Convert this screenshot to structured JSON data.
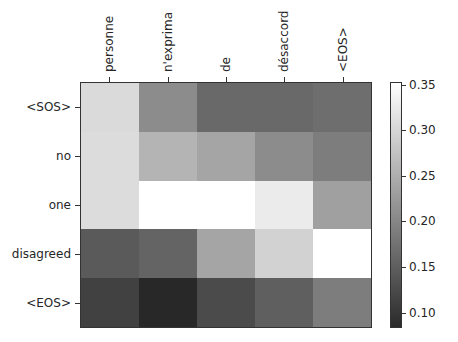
{
  "chart_data": {
    "type": "heatmap",
    "title": "",
    "xlabel": "",
    "ylabel": "",
    "x_labels": [
      "personne",
      "n'exprima",
      "de",
      "désaccord",
      "<EOS>"
    ],
    "y_labels": [
      "<SOS>",
      "no",
      "one",
      "disagreed",
      "<EOS>"
    ],
    "values": [
      [
        0.3,
        0.2,
        0.16,
        0.16,
        0.17
      ],
      [
        0.3,
        0.25,
        0.23,
        0.2,
        0.18
      ],
      [
        0.3,
        0.35,
        0.35,
        0.32,
        0.22
      ],
      [
        0.14,
        0.15,
        0.23,
        0.29,
        0.35
      ],
      [
        0.11,
        0.08,
        0.12,
        0.14,
        0.18
      ]
    ],
    "grays": [
      [
        218,
        140,
        105,
        105,
        110
      ],
      [
        220,
        180,
        165,
        140,
        125
      ],
      [
        220,
        255,
        255,
        235,
        160
      ],
      [
        90,
        100,
        165,
        210,
        255
      ],
      [
        65,
        40,
        75,
        95,
        125
      ]
    ],
    "colormap": "gray",
    "colorbar": {
      "vmin": 0.083,
      "vmax": 0.353,
      "ticks": [
        "0.35",
        "0.30",
        "0.25",
        "0.20",
        "0.15",
        "0.10"
      ],
      "tick_values": [
        0.35,
        0.3,
        0.25,
        0.2,
        0.15,
        0.1
      ]
    },
    "x_tick_position": "top",
    "grid": false
  }
}
